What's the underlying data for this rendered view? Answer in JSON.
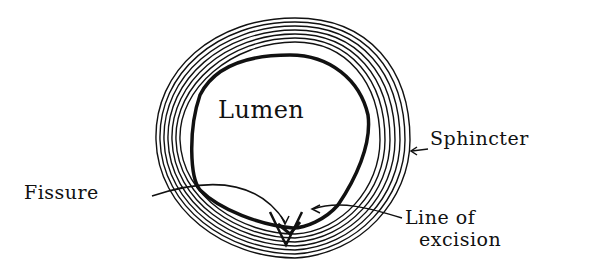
{
  "diagram": {
    "type": "anatomical cross-section sketch",
    "labels": {
      "lumen": "Lumen",
      "sphincter": "Sphincter",
      "fissure": "Fissure",
      "line_of_excision_1": "Line of",
      "line_of_excision_2": "excision"
    },
    "colors": {
      "ink": "#111111",
      "background": "#ffffff"
    }
  }
}
